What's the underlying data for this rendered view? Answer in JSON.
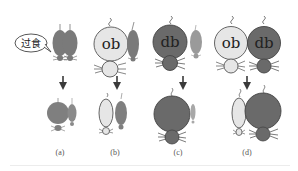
{
  "figure": {
    "colors": {
      "normal_mouse": "#7a7a7a",
      "ob_mouse": "#e6e6e6",
      "db_mouse": "#6a6a6a",
      "outline": "#555555",
      "arrow": "#3a3a3a",
      "background": "#ffffff"
    },
    "bubble": {
      "text": "过食"
    },
    "panels": [
      {
        "id": "a",
        "caption": "(a)",
        "top": {
          "left": "normal",
          "right": "normal"
        },
        "bottom": {
          "left": "normal (overfed, enlarged)",
          "right": "normal"
        }
      },
      {
        "id": "b",
        "caption": "(b)",
        "top": {
          "left": "ob",
          "right": "normal"
        },
        "bottom": {
          "left": "ob (slimmed)",
          "right": "normal"
        }
      },
      {
        "id": "c",
        "caption": "(c)",
        "top": {
          "left": "db",
          "right": "normal"
        },
        "bottom": {
          "left": "db",
          "right": "normal (starved)"
        }
      },
      {
        "id": "d",
        "caption": "(d)",
        "top": {
          "left": "ob",
          "right": "db"
        },
        "bottom": {
          "left": "ob (starved)",
          "right": "db"
        }
      }
    ],
    "labels": {
      "ob": "ob",
      "db": "db"
    }
  }
}
